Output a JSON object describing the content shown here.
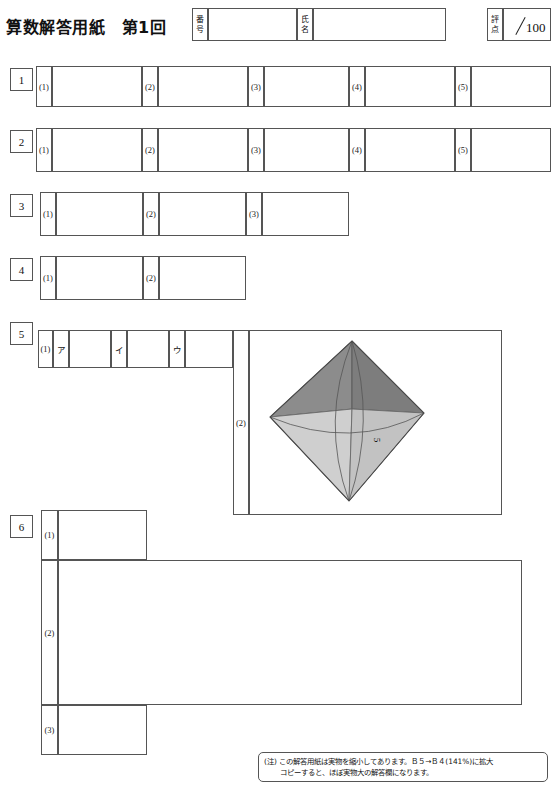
{
  "header": {
    "title": "算数解答用紙　第1回",
    "id_label_chars": [
      "番",
      "号"
    ],
    "name_label_chars": [
      "氏",
      "名"
    ],
    "score_label_chars": [
      "評",
      "点"
    ],
    "score_max": "100",
    "id_value": "",
    "name_value": "",
    "score_value": ""
  },
  "sections": [
    {
      "number": "1",
      "items": [
        {
          "tag": "(1)",
          "unit": "",
          "value": ""
        },
        {
          "tag": "(2)",
          "unit": "",
          "value": ""
        },
        {
          "tag": "(3)",
          "unit": "",
          "value": ""
        },
        {
          "tag": "(4)",
          "unit": "",
          "value": ""
        },
        {
          "tag": "(5)",
          "unit": "",
          "value": ""
        }
      ]
    },
    {
      "number": "2",
      "items": [
        {
          "tag": "(1)",
          "unit": "cm",
          "unit_sup": "3",
          "value": ""
        },
        {
          "tag": "(2)",
          "unit": "cm",
          "unit_sup": "2",
          "value": ""
        },
        {
          "tag": "(3)",
          "unit": "通り",
          "value": ""
        },
        {
          "tag": "(4)",
          "unit": "点",
          "value": ""
        },
        {
          "tag": "(5)",
          "unit": "円",
          "value": ""
        }
      ]
    },
    {
      "number": "3",
      "items": [
        {
          "tag": "(1)",
          "unit": "cm",
          "value": ""
        },
        {
          "tag": "(2)",
          "unit": "cm",
          "value": ""
        },
        {
          "tag": "(3)",
          "unit": "cm",
          "value": ""
        }
      ]
    },
    {
      "number": "4",
      "items": [
        {
          "tag": "(1)",
          "unit": "km",
          "value": ""
        },
        {
          "tag": "(2)",
          "unit": "km",
          "value": ""
        }
      ]
    },
    {
      "number": "5",
      "items": [
        {
          "tag": "(1)",
          "sublabels": [
            "ア",
            "イ",
            "ウ"
          ],
          "value": ""
        },
        {
          "tag": "(2)",
          "unit": "",
          "value": ""
        }
      ]
    },
    {
      "number": "6",
      "items": [
        {
          "tag": "(1)",
          "unit": "",
          "value": ""
        },
        {
          "tag": "(2)",
          "unit": "",
          "value": ""
        },
        {
          "tag": "(3)",
          "unit": "番目",
          "value": ""
        }
      ]
    }
  ],
  "figure": {
    "name": "octahedron",
    "edge_label": "5",
    "top_face_color": "#8a8a8a",
    "left_face_color": "#a8a8a8",
    "bottom_face_color": "#c9c9c9",
    "right_face_color": "#bdbdbd"
  },
  "answer_box": {
    "label": "答え",
    "value": ""
  },
  "note": {
    "marker": "(注)",
    "line1": "この解答用紙は実物を縮小してあります。Ｂ５→Ｂ４(141%)に拡大",
    "line2": "コピーすると、ほぼ実物大の解答欄になります。"
  },
  "footer_scrap": ""
}
